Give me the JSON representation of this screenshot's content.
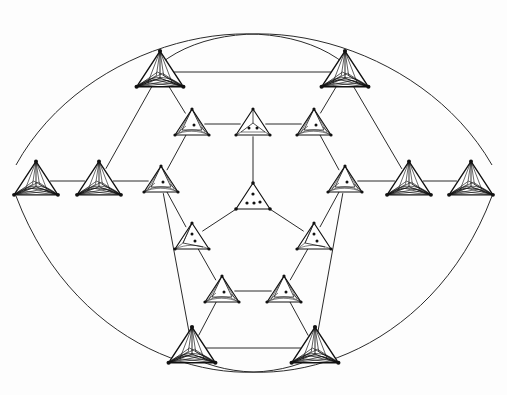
{
  "figure": {
    "background_color": "#fdfdfd",
    "line_color": "#2b2b2b",
    "node_stroke_color": "#111111",
    "node_fill_color": "#ffffff",
    "width": 507,
    "height": 395
  },
  "chart_data": {
    "type": "diagram",
    "xlabel": "",
    "ylabel": "",
    "node_kinds": {
      "dense": "dense tetrahedron with interior apex and many chords, no dots",
      "spiral1": "tetrahedron with spiral interior and one dot",
      "spiral2": "tetrahedron with interior apex and two dots",
      "ysplit2": "triangle with central Y split and two dots",
      "plain4": "plain triangle with four interior dots"
    },
    "nodes": [
      {
        "id": "L1",
        "kind": "dense",
        "x": 36,
        "y": 181,
        "size": 30,
        "dots": 0
      },
      {
        "id": "L2",
        "kind": "dense",
        "x": 99,
        "y": 181,
        "size": 30,
        "dots": 0
      },
      {
        "id": "R2",
        "kind": "dense",
        "x": 409,
        "y": 181,
        "size": 30,
        "dots": 0
      },
      {
        "id": "R1",
        "kind": "dense",
        "x": 471,
        "y": 181,
        "size": 30,
        "dots": 0
      },
      {
        "id": "T1",
        "kind": "dense",
        "x": 160,
        "y": 72,
        "size": 32,
        "dots": 0
      },
      {
        "id": "T2",
        "kind": "dense",
        "x": 345,
        "y": 72,
        "size": 32,
        "dots": 0
      },
      {
        "id": "B1",
        "kind": "dense",
        "x": 192,
        "y": 348,
        "size": 32,
        "dots": 0
      },
      {
        "id": "B2",
        "kind": "dense",
        "x": 315,
        "y": 348,
        "size": 32,
        "dots": 0
      },
      {
        "id": "H_UL",
        "kind": "spiral1",
        "x": 192,
        "y": 124,
        "size": 26,
        "dots": 1
      },
      {
        "id": "H_UC",
        "kind": "ysplit2",
        "x": 253,
        "y": 124,
        "size": 26,
        "dots": 2
      },
      {
        "id": "H_UR",
        "kind": "spiral1",
        "x": 314,
        "y": 124,
        "size": 26,
        "dots": 1
      },
      {
        "id": "H_ML",
        "kind": "spiral1",
        "x": 161,
        "y": 181,
        "size": 26,
        "dots": 1
      },
      {
        "id": "H_MR",
        "kind": "spiral1",
        "x": 345,
        "y": 181,
        "size": 26,
        "dots": 1
      },
      {
        "id": "H_LL",
        "kind": "spiral2",
        "x": 192,
        "y": 238,
        "size": 26,
        "dots": 2
      },
      {
        "id": "H_LR",
        "kind": "spiral2",
        "x": 314,
        "y": 238,
        "size": 26,
        "dots": 2
      },
      {
        "id": "I_BL",
        "kind": "spiral1",
        "x": 222,
        "y": 291,
        "size": 26,
        "dots": 1
      },
      {
        "id": "I_BR",
        "kind": "spiral1",
        "x": 284,
        "y": 291,
        "size": 26,
        "dots": 1
      },
      {
        "id": "C",
        "kind": "plain4",
        "x": 253,
        "y": 198,
        "size": 26,
        "dots": 4
      }
    ],
    "straight_edges": [
      [
        "L1",
        "L2"
      ],
      [
        "L2",
        "H_ML"
      ],
      [
        "R1",
        "R2"
      ],
      [
        "R2",
        "H_MR"
      ],
      [
        "T1",
        "T2"
      ],
      [
        "B1",
        "B2"
      ],
      [
        "H_UL",
        "H_UC"
      ],
      [
        "H_UC",
        "H_UR"
      ],
      [
        "T1",
        "H_UL"
      ],
      [
        "T2",
        "H_UR"
      ],
      [
        "T1",
        "L2"
      ],
      [
        "T2",
        "R2"
      ],
      [
        "H_ML",
        "H_UL"
      ],
      [
        "H_MR",
        "H_UR"
      ],
      [
        "H_ML",
        "H_LL"
      ],
      [
        "H_MR",
        "H_LR"
      ],
      [
        "H_LL",
        "I_BL"
      ],
      [
        "H_LR",
        "I_BR"
      ],
      [
        "I_BL",
        "I_BR"
      ],
      [
        "B1",
        "I_BL"
      ],
      [
        "B2",
        "I_BR"
      ],
      [
        "B1",
        "H_ML"
      ],
      [
        "B2",
        "H_MR"
      ],
      [
        "C",
        "H_UC"
      ],
      [
        "C",
        "H_LL"
      ],
      [
        "C",
        "H_LR"
      ]
    ],
    "arcs": [
      {
        "from": "T1",
        "to": "R1",
        "note": "long arc over the top to the far right node"
      },
      {
        "from": "T2",
        "to": "L1",
        "note": "long arc over the top to the far left node"
      },
      {
        "from": "B1",
        "to": "R1",
        "note": "long arc under the bottom to the far right node"
      },
      {
        "from": "B2",
        "to": "L1",
        "note": "long arc under the bottom to the far left node"
      }
    ],
    "arc_crossings": [
      {
        "x": 253,
        "y": 25,
        "location": "top-center"
      },
      {
        "x": 253,
        "y": 370,
        "location": "bottom-center"
      }
    ],
    "symmetry": "three-fold / hexagonal with reflection"
  }
}
